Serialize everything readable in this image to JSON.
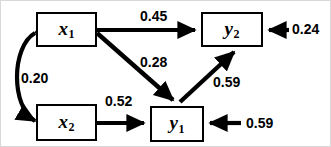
{
  "diagram": {
    "type": "path-diagram",
    "title": "",
    "nodes": [
      {
        "id": "x1",
        "label": "x",
        "subscript": "1",
        "x": 35,
        "y": 11,
        "w": 61,
        "h": 35
      },
      {
        "id": "x2",
        "label": "x",
        "subscript": "2",
        "x": 35,
        "y": 103,
        "w": 61,
        "h": 37
      },
      {
        "id": "y1",
        "label": "y",
        "subscript": "1",
        "x": 149,
        "y": 105,
        "w": 54,
        "h": 36
      },
      {
        "id": "y2",
        "label": "y",
        "subscript": "2",
        "x": 200,
        "y": 11,
        "w": 62,
        "h": 35
      }
    ],
    "edges": [
      {
        "id": "x1-y2",
        "from": "x1",
        "to": "y2",
        "coefficient": "0.45",
        "style": "straight-arrow",
        "label_x": 139,
        "label_y": 8
      },
      {
        "id": "x1-y1",
        "from": "x1",
        "to": "y1",
        "coefficient": "0.28",
        "style": "straight-arrow",
        "label_x": 139,
        "label_y": 54
      },
      {
        "id": "x2-y1",
        "from": "x2",
        "to": "y1",
        "coefficient": "0.52",
        "style": "straight-arrow",
        "label_x": 104,
        "label_y": 93
      },
      {
        "id": "y1-y2",
        "from": "y1",
        "to": "y2",
        "coefficient": "0.59",
        "style": "straight-arrow",
        "label_x": 212,
        "label_y": 74
      },
      {
        "id": "x1-x2",
        "from": "x1",
        "to": "x2",
        "coefficient": "0.20",
        "style": "curved-double-arrow",
        "label_x": 20,
        "label_y": 70
      },
      {
        "id": "resid-y2",
        "from": "residual",
        "to": "y2",
        "coefficient": "0.24",
        "style": "residual-arrow",
        "label_x": 291,
        "label_y": 21
      },
      {
        "id": "resid-y1",
        "from": "residual",
        "to": "y1",
        "coefficient": "0.59",
        "style": "residual-arrow",
        "label_x": 245,
        "label_y": 115
      }
    ]
  },
  "labels": {
    "x1": "x",
    "x1_sub": "1",
    "x2": "x",
    "x2_sub": "2",
    "y1": "y",
    "y1_sub": "1",
    "y2": "y",
    "y2_sub": "2",
    "coef_x1_y2": "0.45",
    "coef_x1_y1": "0.28",
    "coef_x2_y1": "0.52",
    "coef_y1_y2": "0.59",
    "coef_x1_x2": "0.20",
    "coef_resid_y2": "0.24",
    "coef_resid_y1": "0.59"
  },
  "colors": {
    "stroke": "#000000",
    "background": "#ffffff",
    "frame": "#d8d8d8"
  }
}
